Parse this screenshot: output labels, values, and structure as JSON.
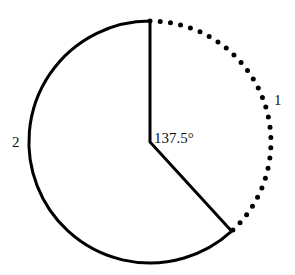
{
  "diagram": {
    "center": {
      "x": 150,
      "y": 142
    },
    "radius": 121,
    "angle_degrees": 137.5,
    "angle_label": "137.5°",
    "arcs": [
      {
        "id": "1",
        "label": "1",
        "style": "dotted",
        "span_degrees": 137.5
      },
      {
        "id": "2",
        "label": "2",
        "style": "solid",
        "span_degrees": 222.5
      }
    ],
    "colors": {
      "stroke": "#000000",
      "background": "#ffffff"
    }
  }
}
